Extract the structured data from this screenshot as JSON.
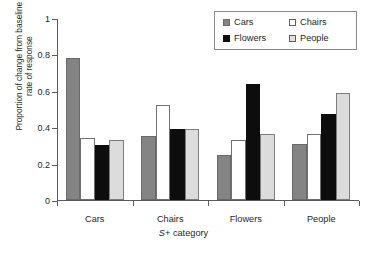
{
  "chart_data": {
    "type": "bar",
    "title": "",
    "xlabel": "S+ category",
    "ylabel": "Proportion of change from baseline\nrate of response",
    "categories": [
      "Cars",
      "Chairs",
      "Flowers",
      "People"
    ],
    "series": [
      {
        "name": "Cars",
        "color": "#848484",
        "values": [
          0.78,
          0.35,
          0.25,
          0.31
        ]
      },
      {
        "name": "Chairs",
        "color": "#ffffff",
        "values": [
          0.34,
          0.52,
          0.33,
          0.36
        ]
      },
      {
        "name": "Flowers",
        "color": "#0d0d0d",
        "values": [
          0.3,
          0.39,
          0.64,
          0.47
        ]
      },
      {
        "name": "People",
        "color": "#dcdcdc",
        "values": [
          0.33,
          0.39,
          0.36,
          0.59
        ]
      }
    ],
    "ylim": [
      0,
      1
    ],
    "yticks": [
      "0",
      "0.2",
      "0.4",
      "0.6",
      "0.8",
      "1"
    ],
    "ytick_values": [
      0,
      0.2,
      0.4,
      0.6,
      0.8,
      1
    ],
    "grid": false,
    "legend_position": "top-right",
    "legend_order": [
      "Cars",
      "Chairs",
      "Flowers",
      "People"
    ]
  },
  "caption": {
    "text": ""
  }
}
